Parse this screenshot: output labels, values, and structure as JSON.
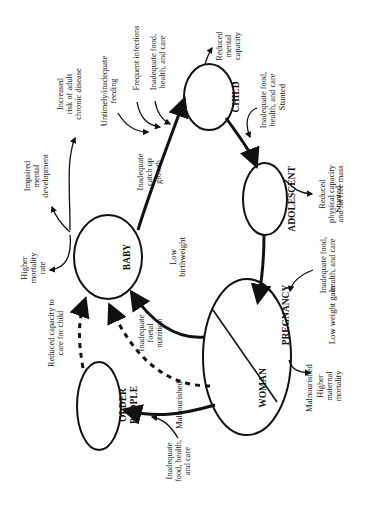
{
  "diagram": {
    "type": "life-cycle",
    "orientation": "rotated-90-ccw",
    "nodes": {
      "baby": {
        "title": "BABY",
        "subtitle": "Low\nbirthweight"
      },
      "child": {
        "title": "CHILD",
        "subtitle": "Stunted"
      },
      "adolescent": {
        "title": "ADOLESCENT",
        "subtitle": "Stunted"
      },
      "pregnancy": {
        "title": "PREGNANCY",
        "subtitle": "Low weight gain"
      },
      "woman": {
        "title": "WOMAN",
        "subtitle": "Malnourished"
      },
      "older": {
        "title": "OLDER\nPEOPLE",
        "subtitle": "Malnourished"
      }
    },
    "labels": {
      "increased_risk": "Increased\nrisk of adult\nchronic disease",
      "untimely_feeding": "Untimely/inadequate\nfeeding",
      "frequent_infections": "Frequent infections",
      "inadequate_child": "Inadequate food,\nhealth, and care",
      "reduced_mental": "Reduced\nmental\ncapacity",
      "inadequate_adolescent": "Inadequate food,\nhealth, and care",
      "reduced_physical": "Reduced\nphysical capacity\nand fat free mass",
      "inadequate_pregnancy": "Inadequate food,\nhealth, and care",
      "higher_maternal": "Higher\nmaternal\nmortality",
      "inadequate_older": "Inadequate\nfood, health,\nand care",
      "reduced_capacity_care": "Reduced capacity to\ncare for child",
      "inadequate_foetal": "Inadequate\nfoetal\nnutrition",
      "impaired_mental": "Impaired\nmental\ndevelopment",
      "higher_mortality": "Higher\nmortality\nrate",
      "inadequate_catchup": "Inadequate\ncatch up\ngrowth"
    },
    "edges": [
      {
        "from": "BABY",
        "to": "CHILD",
        "style": "solid",
        "label": "Inadequate catch up growth"
      },
      {
        "from": "CHILD",
        "to": "ADOLESCENT",
        "style": "solid"
      },
      {
        "from": "ADOLESCENT",
        "to": "PREGNANCY",
        "style": "solid"
      },
      {
        "from": "PREGNANCY",
        "to": "BABY",
        "style": "solid"
      },
      {
        "from": "WOMAN",
        "to": "OLDER PEOPLE",
        "style": "solid"
      },
      {
        "from": "WOMAN",
        "to": "BABY",
        "style": "dashed",
        "label": "Inadequate foetal nutrition"
      },
      {
        "from": "OLDER PEOPLE",
        "to": "BABY",
        "style": "dashed",
        "label": "Reduced capacity to care for child"
      }
    ],
    "colors": {
      "ink": "#111111",
      "background": "#ffffff"
    }
  }
}
